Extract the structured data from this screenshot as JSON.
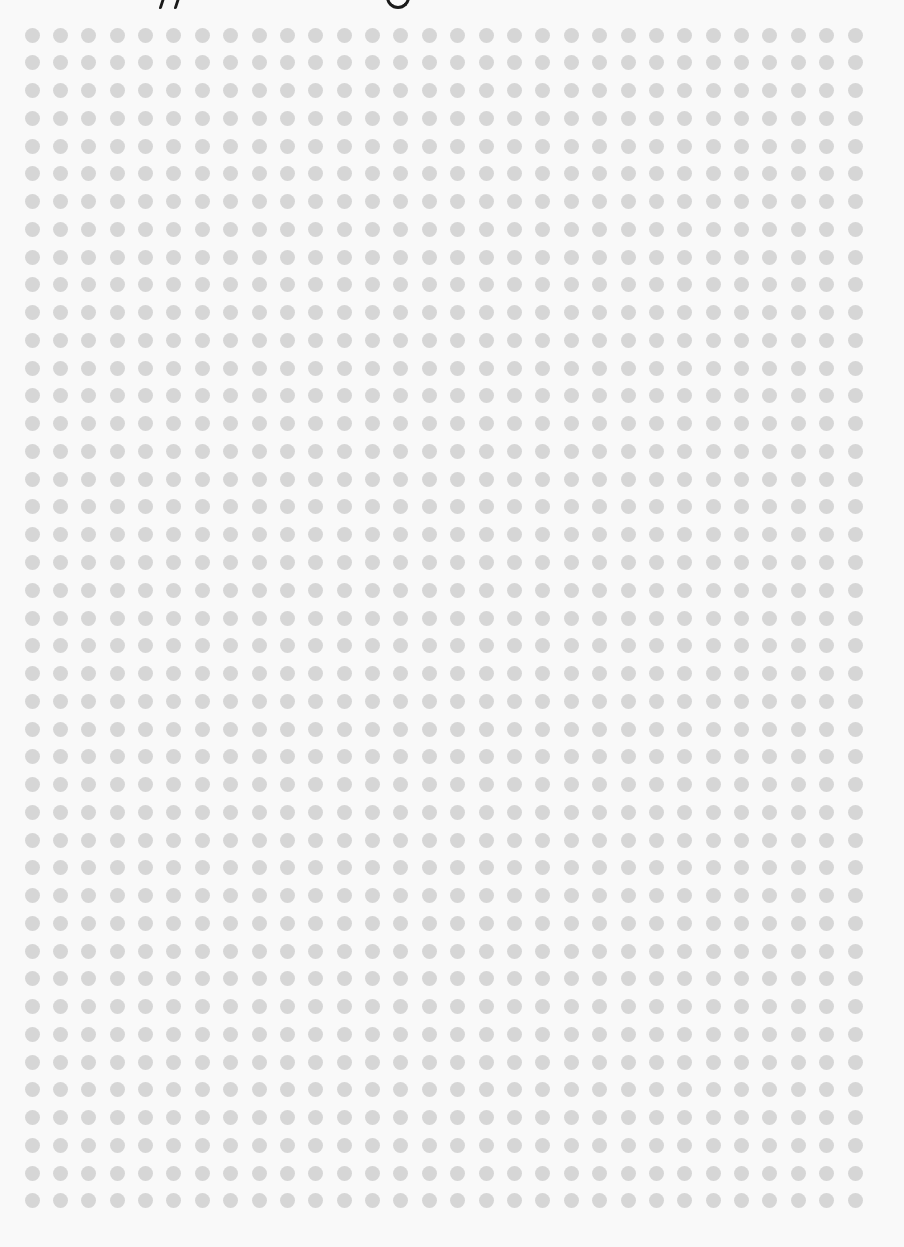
{
  "caption": {
    "visible_text": "",
    "note_fragments": [
      "descender",
      "descender",
      "g"
    ]
  },
  "dot_grid": {
    "columns": 30,
    "rows": 43,
    "first_center_x": 32,
    "first_center_y": 35,
    "spacing_x": 28.38,
    "spacing_y": 27.76,
    "dot_diameter": 15,
    "dot_color": "#d6d6d6",
    "background_color": "#f9f9f9"
  }
}
